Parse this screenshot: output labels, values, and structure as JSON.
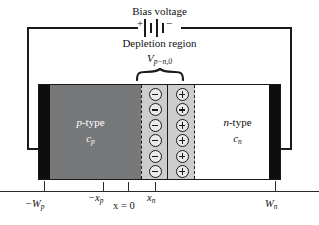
{
  "diagram": {
    "circuit": {
      "bias_label": "Bias voltage",
      "battery": {
        "plus_sign": "+",
        "minus_sign": "−"
      }
    },
    "depletion": {
      "label": "Depletion region",
      "potential_symbol": "V",
      "potential_subscript": "p−n,0"
    },
    "regions": {
      "p": {
        "type_prefix": "p",
        "type_suffix": "-type",
        "concentration_symbol": "c",
        "concentration_subscript": "p"
      },
      "n": {
        "type_prefix": "n",
        "type_suffix": "-type",
        "concentration_symbol": "c",
        "concentration_subscript": "n"
      }
    },
    "charges": {
      "negative_count": 6,
      "positive_count": 6,
      "negative_sign": "−",
      "positive_sign": "+"
    },
    "axis": {
      "ticks": [
        {
          "symbol": "−W",
          "subscript": "p"
        },
        {
          "symbol": "−x",
          "subscript": "p"
        },
        {
          "symbol": "x = 0",
          "subscript": ""
        },
        {
          "symbol": "x",
          "subscript": "n"
        },
        {
          "symbol": "W",
          "subscript": "n"
        }
      ]
    },
    "colors": {
      "p_type_fill": "#77787a",
      "depletion_fill": "#cdcdcd",
      "n_type_fill": "#ffffff",
      "electrode_fill": "#0d0d0d",
      "line": "#1a1a1a",
      "page_background": "#ffffff"
    }
  }
}
